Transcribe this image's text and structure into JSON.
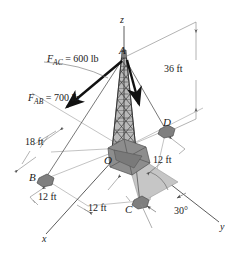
{
  "figure": {
    "type": "engineering-statics-3d-diagram",
    "colors": {
      "line": "#4a4a4a",
      "heavy_line": "#111111",
      "tower_fill": "#8a8a8a",
      "tower_dark": "#3d3d3d",
      "pad_fill": "#909090",
      "pad_dark": "#5a5a5a",
      "shade_fill": "#c6c6c6",
      "text": "#1a1a1a",
      "background": "#ffffff"
    },
    "axes": [
      {
        "name": "z-axis",
        "label": "z"
      },
      {
        "name": "y-axis",
        "label": "y"
      },
      {
        "name": "x-axis",
        "label": "x"
      }
    ],
    "points": [
      {
        "name": "apex",
        "label": "A"
      },
      {
        "name": "anchor-b",
        "label": "B"
      },
      {
        "name": "anchor-c",
        "label": "C"
      },
      {
        "name": "anchor-d",
        "label": "D"
      },
      {
        "name": "origin",
        "label": "O"
      }
    ],
    "forces": [
      {
        "name": "force-ac",
        "symbol": "F",
        "subscript": "AC",
        "equals": " = ",
        "magnitude": "600",
        "unit": "lb",
        "full_label": "F_AC = 600 lb"
      },
      {
        "name": "force-ab",
        "symbol": "F",
        "subscript": "AB",
        "equals": " = ",
        "magnitude": "700",
        "unit": "lb",
        "full_label": "F_AB = 700 lb"
      }
    ],
    "dimensions": [
      {
        "name": "height-oa",
        "label": "36 ft",
        "value": 36,
        "unit": "ft"
      },
      {
        "name": "dim-18ft",
        "label": "18 ft",
        "value": 18,
        "unit": "ft"
      },
      {
        "name": "dim-12ft-b",
        "label": "12 ft",
        "value": 12,
        "unit": "ft"
      },
      {
        "name": "dim-12ft-d",
        "label": "12 ft",
        "value": 12,
        "unit": "ft"
      },
      {
        "name": "dim-12ft-c",
        "label": "12 ft",
        "value": 12,
        "unit": "ft"
      },
      {
        "name": "angle-c",
        "label": "30°",
        "value": 30,
        "unit": "deg"
      }
    ]
  }
}
